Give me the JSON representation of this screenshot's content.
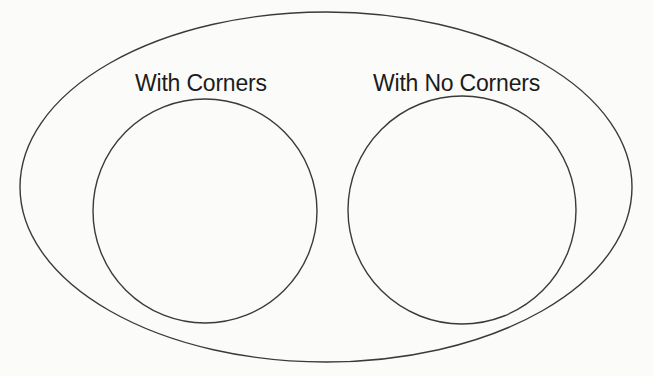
{
  "diagram": {
    "type": "venn",
    "outer_set": {
      "label": "",
      "shape": "ellipse",
      "cx": 326,
      "cy": 187,
      "rx": 306,
      "ry": 175
    },
    "sets": [
      {
        "label": "With Corners",
        "shape": "circle",
        "cx": 205,
        "cy": 211,
        "r": 112
      },
      {
        "label": "With No Corners",
        "shape": "circle",
        "cx": 462,
        "cy": 210,
        "r": 114
      }
    ],
    "stroke_color": "#3a3a3a",
    "background_color": "#fbfbfa"
  }
}
